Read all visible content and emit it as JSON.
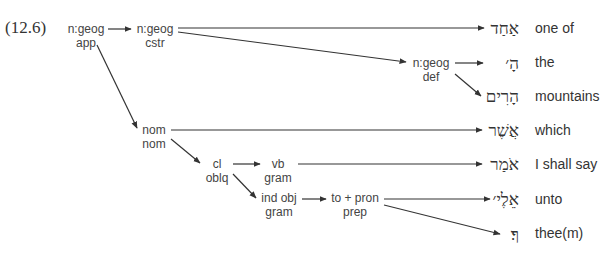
{
  "example_number": "(12.6)",
  "nodes": {
    "app": {
      "top": "n:geog",
      "bottom": "app"
    },
    "cstr": {
      "top": "n:geog",
      "bottom": "cstr"
    },
    "def": {
      "top": "n:geog",
      "bottom": "def"
    },
    "nom": {
      "top": "nom",
      "bottom": "nom"
    },
    "cl": {
      "top": "cl",
      "bottom": "oblq"
    },
    "vb": {
      "top": "vb",
      "bottom": "gram"
    },
    "indobj": {
      "top": "ind obj",
      "bottom": "gram"
    },
    "prep": {
      "top": "to + pron",
      "bottom": "prep"
    }
  },
  "words": [
    {
      "hebrew": "אַחַד",
      "gloss": "one of"
    },
    {
      "hebrew": "הָ׳",
      "gloss": "the"
    },
    {
      "hebrew": "הָרִים",
      "gloss": "mountains"
    },
    {
      "hebrew": "אֲשֶׁר",
      "gloss": "which"
    },
    {
      "hebrew": "אֹמַר",
      "gloss": "I shall say"
    },
    {
      "hebrew": "אֵלֶי׳",
      "gloss": "unto"
    },
    {
      "hebrew": "ךָ׃",
      "gloss": "thee(m)"
    }
  ],
  "colors": {
    "line": "#333333",
    "text": "#333333"
  }
}
